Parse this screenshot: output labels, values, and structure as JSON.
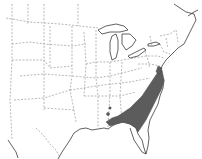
{
  "map": {
    "region": "Eastern United States",
    "style": "grayscale outline map with dashed state boundaries",
    "colors": {
      "background": "#ffffff",
      "coastline": "#3a3a3a",
      "state_border": "#888888",
      "range_fill": "#5c5c5c"
    },
    "shaded_range": {
      "description": "Atlantic and Gulf coastal plain: southeastern Virginia, eastern North Carolina, South Carolina, Georgia, north Florida and Florida panhandle, southern Alabama"
    }
  }
}
